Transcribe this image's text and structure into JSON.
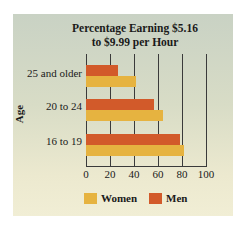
{
  "chart_data": {
    "type": "bar",
    "orientation": "horizontal",
    "title": "Percentage Earning $5.16 to $9.99 per Hour",
    "title_lines": [
      "Percentage Earning $5.16",
      "to $9.99 per Hour"
    ],
    "xlabel": "",
    "ylabel": "Age",
    "categories": [
      "25 and older",
      "20 to 24",
      "16 to 19"
    ],
    "series": [
      {
        "name": "Men",
        "color": "#d25a2a",
        "values": [
          27,
          57,
          78
        ]
      },
      {
        "name": "Women",
        "color": "#e6b340",
        "values": [
          42,
          64,
          82
        ]
      }
    ],
    "xlim": [
      0,
      100
    ],
    "xticks": [
      "0",
      "20",
      "40",
      "60",
      "80",
      "100"
    ],
    "grid": true,
    "legend": {
      "position": "bottom",
      "entries": [
        "Women",
        "Men"
      ]
    }
  }
}
